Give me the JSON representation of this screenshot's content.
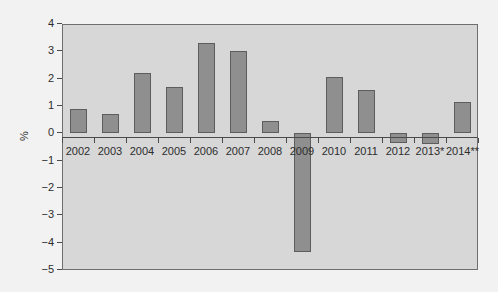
{
  "chart_data": {
    "type": "bar",
    "title": "",
    "subtitle": "",
    "xlabel": "",
    "ylabel": "%",
    "categories": [
      "2002",
      "2003",
      "2004",
      "2005",
      "2006",
      "2007",
      "2008",
      "2009",
      "2010",
      "2011",
      "2012",
      "2013*",
      "2014**"
    ],
    "values": [
      0.9,
      0.7,
      2.2,
      1.7,
      3.3,
      3.0,
      0.45,
      -4.35,
      2.05,
      1.6,
      -0.35,
      -0.4,
      1.15
    ],
    "ylim": [
      -5,
      4
    ],
    "yticks": [
      4,
      3,
      2,
      1,
      0,
      -1,
      -2,
      -3,
      -4,
      -5
    ],
    "ytick_labels": [
      "4",
      "3",
      "2",
      "1",
      "0",
      "−1",
      "−2",
      "−3",
      "−4",
      "−5"
    ],
    "grid": false,
    "legend": false,
    "legend_position": "none",
    "annotations": [
      "* denotes provisional value for 2013",
      "** denotes forecast value for 2014"
    ],
    "colors": {
      "bar_fill": "#8f8f8f",
      "bar_border": "#5d5d5d",
      "plot_background": "#d7d7d7",
      "figure_background": "#f2f2f2",
      "axis": "#4a4a4a",
      "text": "#2d2d2d"
    }
  }
}
